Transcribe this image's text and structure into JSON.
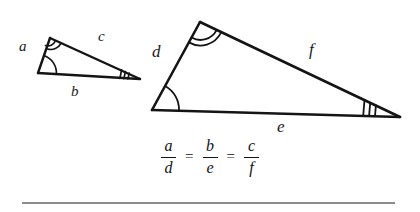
{
  "figure": {
    "ink_color": "#141414",
    "rule_color": "#8c8c8c",
    "background_color": "#ffffff"
  },
  "small_triangle": {
    "name": "small-triangle",
    "vertices": {
      "apex": [
        50,
        38
      ],
      "bottom_left": [
        38,
        73
      ],
      "right": [
        140,
        79
      ]
    },
    "labels": {
      "side_a": "a",
      "side_b": "b",
      "side_c": "c"
    },
    "angle_marks": {
      "apex": "double-arc",
      "bottom_left": "single-arc",
      "right": "triple-tick"
    }
  },
  "large_triangle": {
    "name": "large-triangle",
    "vertices": {
      "apex": [
        200,
        22
      ],
      "bottom_left": [
        152,
        110
      ],
      "right": [
        400,
        117
      ]
    },
    "labels": {
      "side_d": "d",
      "side_e": "e",
      "side_f": "f"
    },
    "angle_marks": {
      "apex": "double-arc",
      "bottom_left": "single-arc",
      "right": "triple-tick"
    }
  },
  "equation": {
    "terms": [
      {
        "numerator": "a",
        "denominator": "d"
      },
      {
        "numerator": "b",
        "denominator": "e"
      },
      {
        "numerator": "c",
        "denominator": "f"
      }
    ],
    "operator": "=",
    "plain_text": "a/d = b/e = c/f"
  }
}
